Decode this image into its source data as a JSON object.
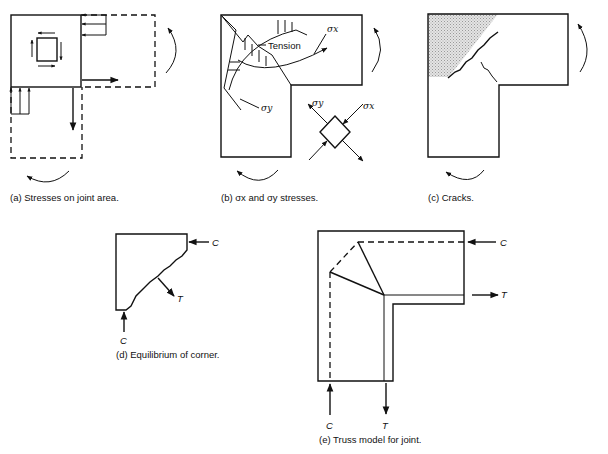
{
  "figure": {
    "panels": [
      {
        "id": "a",
        "caption": "(a)  Stresses on joint area."
      },
      {
        "id": "b",
        "caption": "(b)  σx and σy stresses.",
        "labels": {
          "tension": "Tension",
          "sigma_x": "σx",
          "sigma_y": "σy"
        }
      },
      {
        "id": "c",
        "caption": "(c)  Cracks."
      },
      {
        "id": "d",
        "caption": "(d)  Equilibrium of corner.",
        "labels": {
          "compression_top": "C",
          "tension": "T",
          "compression_bottom": "C"
        }
      },
      {
        "id": "e",
        "caption": "(e)  Truss model for joint.",
        "labels": {
          "compression_right": "C",
          "tension_right": "T",
          "compression_bottom": "C",
          "tension_bottom": "T"
        }
      }
    ]
  }
}
